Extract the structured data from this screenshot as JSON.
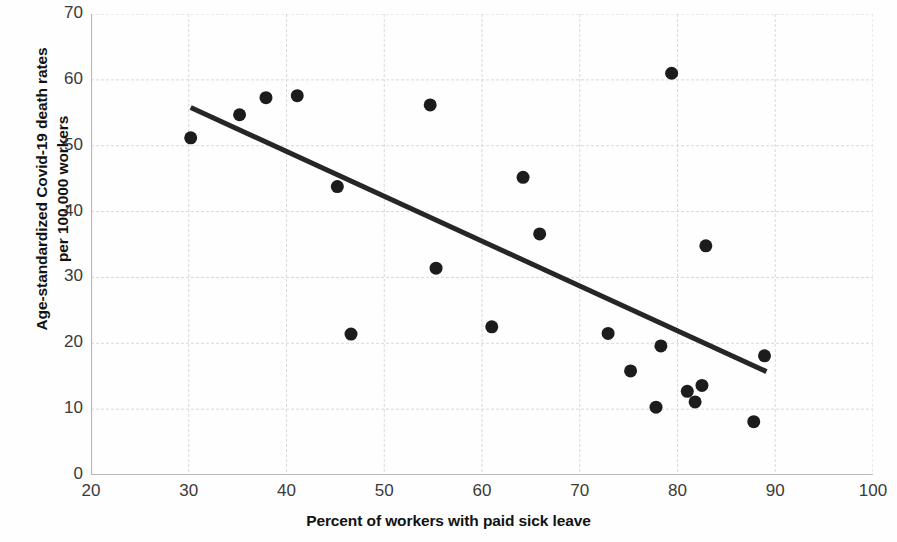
{
  "chart_data": {
    "type": "scatter",
    "title": "",
    "xlabel": "Percent of workers with paid sick leave",
    "ylabel_line1": "Age-standardized Covid-19 death rates",
    "ylabel_line2": "per 100,000 workers",
    "xlim": [
      20,
      100
    ],
    "ylim": [
      0,
      70
    ],
    "xticks": [
      20,
      30,
      40,
      50,
      60,
      70,
      80,
      90,
      100
    ],
    "yticks": [
      0,
      10,
      20,
      30,
      40,
      50,
      60,
      70
    ],
    "xtick_labels": [
      "20",
      "30",
      "40",
      "50",
      "60",
      "70",
      "80",
      "90",
      "100"
    ],
    "ytick_labels": [
      "0",
      "10",
      "20",
      "30",
      "40",
      "50",
      "60",
      "70"
    ],
    "grid": true,
    "grid_color": "#d9d9d9",
    "legend": "none",
    "marker_color": "#1c1c1c",
    "marker_size_px": 13,
    "trendline": {
      "type": "linear",
      "color": "#262626",
      "width_px": 5,
      "x_start": 30.2,
      "y_start": 55.8,
      "x_end": 89.1,
      "y_end": 15.7
    },
    "points": [
      {
        "x": 30.2,
        "y": 51.2
      },
      {
        "x": 35.2,
        "y": 54.7
      },
      {
        "x": 37.9,
        "y": 57.3
      },
      {
        "x": 41.1,
        "y": 57.6
      },
      {
        "x": 45.2,
        "y": 43.8
      },
      {
        "x": 46.6,
        "y": 21.4
      },
      {
        "x": 54.7,
        "y": 56.2
      },
      {
        "x": 55.3,
        "y": 31.4
      },
      {
        "x": 61.0,
        "y": 22.5
      },
      {
        "x": 64.2,
        "y": 45.2
      },
      {
        "x": 65.9,
        "y": 36.6
      },
      {
        "x": 72.9,
        "y": 21.5
      },
      {
        "x": 75.2,
        "y": 15.8
      },
      {
        "x": 77.8,
        "y": 10.3
      },
      {
        "x": 78.3,
        "y": 19.6
      },
      {
        "x": 79.4,
        "y": 61.0
      },
      {
        "x": 81.0,
        "y": 12.7
      },
      {
        "x": 81.8,
        "y": 11.1
      },
      {
        "x": 82.5,
        "y": 13.6
      },
      {
        "x": 82.9,
        "y": 34.8
      },
      {
        "x": 87.8,
        "y": 8.1
      },
      {
        "x": 88.9,
        "y": 18.1
      }
    ]
  }
}
